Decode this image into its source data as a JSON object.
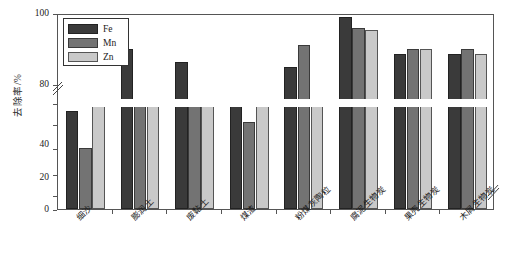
{
  "chart_data": {
    "type": "bar",
    "title": "",
    "xlabel": "",
    "ylabel": "去除率/%",
    "ylim": [
      0,
      100
    ],
    "axis_break": {
      "lower_max": 40,
      "upper_min": 80,
      "present": true
    },
    "yticks": [
      0,
      20,
      40,
      80,
      100
    ],
    "ytick_labels": [
      "0",
      "20",
      "40",
      "80",
      "100"
    ],
    "grid": false,
    "legend_position": "upper-left",
    "categories": [
      "细沙",
      "膨润土",
      "废黏土",
      "煤渣",
      "粉煤灰陶粒",
      "腐泥生物炭",
      "果壳生物炭",
      "木屑生物炭"
    ],
    "series": [
      {
        "name": "Fe",
        "color": "#3a3a3a",
        "values": [
          37,
          92,
          89,
          79,
          88,
          99.5,
          91,
          91
        ]
      },
      {
        "name": "Mn",
        "color": "#737373",
        "values": [
          23,
          44,
          44,
          33,
          93,
          97,
          92,
          92
        ]
      },
      {
        "name": "Zn",
        "color": "#c9c9c9",
        "values": [
          39,
          47,
          46,
          42,
          51,
          96.5,
          92,
          91
        ]
      }
    ]
  },
  "legend": {
    "items": [
      {
        "label": "Fe",
        "key": "fe"
      },
      {
        "label": "Mn",
        "key": "mn"
      },
      {
        "label": "Zn",
        "key": "zn"
      }
    ]
  },
  "axis": {
    "y_title": "去除率/%",
    "y_labels": [
      "100",
      "80",
      "40",
      "20",
      "0"
    ]
  }
}
